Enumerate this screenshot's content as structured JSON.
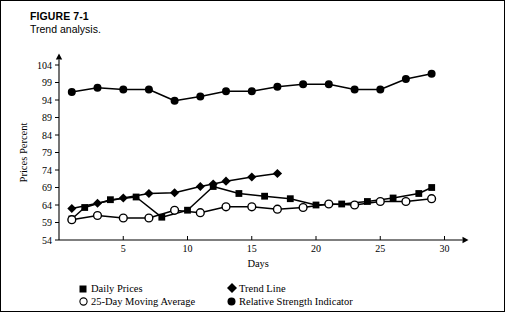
{
  "figure": {
    "number_label": "FIGURE 7-1",
    "title": "Trend analysis."
  },
  "colors": {
    "ink": "#000000",
    "background": "#ffffff"
  },
  "legend": {
    "position": "below-axes",
    "entries": [
      {
        "marker": "filled-square",
        "label": "Daily Prices"
      },
      {
        "marker": "filled-diamond",
        "label": "Trend Line"
      },
      {
        "marker": "open-circle",
        "label": "25-Day Moving Average"
      },
      {
        "marker": "filled-circle",
        "label": "Relative Strength Indicator"
      }
    ]
  },
  "chart_data": {
    "type": "line",
    "title": "Trend analysis.",
    "xlabel": "Days",
    "ylabel": "Prices Percent",
    "xlim": [
      0,
      31
    ],
    "ylim": [
      54,
      106
    ],
    "xticks": [
      5,
      10,
      15,
      20,
      25,
      30
    ],
    "yticks": [
      54,
      59,
      64,
      69,
      74,
      79,
      84,
      89,
      94,
      99,
      104
    ],
    "grid": false,
    "legend_position": "below",
    "series": [
      {
        "name": "Daily Prices",
        "marker": "filled-square",
        "points": [
          {
            "x": 1,
            "y": 60.0
          },
          {
            "x": 2,
            "y": 63.3
          },
          {
            "x": 4,
            "y": 65.5
          },
          {
            "x": 6,
            "y": 66.3
          },
          {
            "x": 8,
            "y": 60.5
          },
          {
            "x": 10,
            "y": 62.5
          },
          {
            "x": 12,
            "y": 69.3
          },
          {
            "x": 14,
            "y": 67.3
          },
          {
            "x": 16,
            "y": 66.5
          },
          {
            "x": 18,
            "y": 65.8
          },
          {
            "x": 20,
            "y": 64.0
          },
          {
            "x": 22,
            "y": 64.3
          },
          {
            "x": 24,
            "y": 65.0
          },
          {
            "x": 26,
            "y": 66.0
          },
          {
            "x": 28,
            "y": 67.3
          },
          {
            "x": 29,
            "y": 69.0
          }
        ]
      },
      {
        "name": "Trend Line",
        "marker": "filled-diamond",
        "points": [
          {
            "x": 1,
            "y": 63.0
          },
          {
            "x": 3,
            "y": 64.5
          },
          {
            "x": 5,
            "y": 66.0
          },
          {
            "x": 7,
            "y": 67.3
          },
          {
            "x": 9,
            "y": 67.5
          },
          {
            "x": 11,
            "y": 69.3
          },
          {
            "x": 12,
            "y": 70.0
          },
          {
            "x": 13,
            "y": 70.8
          },
          {
            "x": 15,
            "y": 72.0
          },
          {
            "x": 17,
            "y": 73.0
          }
        ]
      },
      {
        "name": "25-Day Moving Average",
        "marker": "open-circle",
        "points": [
          {
            "x": 1,
            "y": 59.8
          },
          {
            "x": 3,
            "y": 61.0
          },
          {
            "x": 5,
            "y": 60.3
          },
          {
            "x": 7,
            "y": 60.3
          },
          {
            "x": 9,
            "y": 62.5
          },
          {
            "x": 11,
            "y": 61.8
          },
          {
            "x": 13,
            "y": 63.5
          },
          {
            "x": 15,
            "y": 63.5
          },
          {
            "x": 17,
            "y": 62.8
          },
          {
            "x": 19,
            "y": 63.3
          },
          {
            "x": 21,
            "y": 64.3
          },
          {
            "x": 23,
            "y": 64.0
          },
          {
            "x": 25,
            "y": 65.0
          },
          {
            "x": 27,
            "y": 65.0
          },
          {
            "x": 29,
            "y": 65.8
          }
        ]
      },
      {
        "name": "Relative Strength Indicator",
        "marker": "filled-circle",
        "points": [
          {
            "x": 1,
            "y": 96.3
          },
          {
            "x": 3,
            "y": 97.5
          },
          {
            "x": 5,
            "y": 97.0
          },
          {
            "x": 7,
            "y": 97.0
          },
          {
            "x": 9,
            "y": 93.8
          },
          {
            "x": 11,
            "y": 95.0
          },
          {
            "x": 13,
            "y": 96.5
          },
          {
            "x": 15,
            "y": 96.5
          },
          {
            "x": 17,
            "y": 97.8
          },
          {
            "x": 19,
            "y": 98.5
          },
          {
            "x": 21,
            "y": 98.5
          },
          {
            "x": 23,
            "y": 97.0
          },
          {
            "x": 25,
            "y": 97.0
          },
          {
            "x": 27,
            "y": 100.0
          },
          {
            "x": 29,
            "y": 101.5
          }
        ]
      }
    ]
  }
}
